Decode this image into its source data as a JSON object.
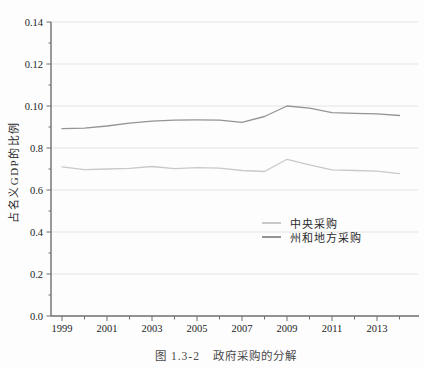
{
  "figure": {
    "y_axis_title": "占名义GDP的比例",
    "caption_prefix": "图 1.3-2",
    "caption_title": "政府采购的分解"
  },
  "chart_data": {
    "type": "line",
    "xlabel": "",
    "ylabel": "占名义GDP的比例",
    "x": [
      1999,
      2000,
      2001,
      2002,
      2003,
      2004,
      2005,
      2006,
      2007,
      2008,
      2009,
      2010,
      2011,
      2012,
      2013,
      2014
    ],
    "series": [
      {
        "name": "中央采购",
        "color": "#c9c9c9",
        "values": [
          0.071,
          0.0697,
          0.07,
          0.0703,
          0.0712,
          0.0702,
          0.0706,
          0.0704,
          0.0693,
          0.0688,
          0.0746,
          0.072,
          0.0696,
          0.0693,
          0.069,
          0.0678
        ]
      },
      {
        "name": "州和地方采购",
        "color": "#949494",
        "values": [
          0.0892,
          0.0895,
          0.0905,
          0.0918,
          0.0928,
          0.0933,
          0.0934,
          0.0933,
          0.0922,
          0.095,
          0.1,
          0.099,
          0.0968,
          0.0965,
          0.0963,
          0.0955
        ]
      }
    ],
    "ylim": [
      0,
      0.14
    ],
    "y_ticks": [
      {
        "value": 0.0,
        "label": "0.0"
      },
      {
        "value": 0.02,
        "label": "0.2"
      },
      {
        "value": 0.04,
        "label": "0.4"
      },
      {
        "value": 0.06,
        "label": "0.6"
      },
      {
        "value": 0.08,
        "label": "0.8"
      },
      {
        "value": 0.1,
        "label": "0.10"
      },
      {
        "value": 0.12,
        "label": "0.12"
      },
      {
        "value": 0.14,
        "label": "0.14"
      }
    ],
    "y_minor_ticks": [
      0.01,
      0.03,
      0.05,
      0.07,
      0.09,
      0.11,
      0.13
    ],
    "x_major_years": [
      1999,
      2001,
      2003,
      2005,
      2007,
      2009,
      2011,
      2013
    ],
    "x_tick_labels": [
      "1999",
      "2001",
      "2003",
      "2005",
      "2007",
      "2009",
      "2011",
      "2013"
    ],
    "grid": "horizontal",
    "legend_position": "center-right",
    "colors": {
      "grid": "#e3e3e3",
      "axis": "#6e6e6e",
      "tick_text": "#1c1c1c",
      "caption_text": "#4a4a4a"
    }
  },
  "legend": {
    "items": [
      {
        "label": "中央采购"
      },
      {
        "label": "州和地方采购"
      }
    ]
  }
}
